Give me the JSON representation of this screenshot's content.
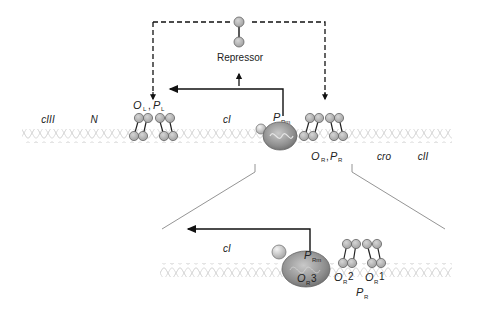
{
  "top": {
    "repressor_label": "Repressor",
    "genes": {
      "cIII": "cIII",
      "N": "N",
      "cI": "cI",
      "cro": "cro",
      "cII": "cII"
    },
    "left_operator": {
      "O": "O",
      "O_sub": "L",
      "sep": ",",
      "P": "P",
      "P_sub": "L"
    },
    "promoter_rm": {
      "P": "P",
      "P_sub": "Rm"
    },
    "right_operator": {
      "O": "O",
      "O_sub": "R",
      "sep": ",",
      "P": "P",
      "P_sub": "R"
    }
  },
  "zoom": {
    "cI": "cI",
    "promoter_rm": {
      "P": "P",
      "P_sub": "Rm"
    },
    "or3": {
      "O": "O",
      "sub": "R",
      "num": "3"
    },
    "or2": {
      "O": "O",
      "sub": "R",
      "num": "2"
    },
    "or1": {
      "O": "O",
      "sub": "R",
      "num": "1"
    },
    "pr": {
      "P": "P",
      "P_sub": "R"
    }
  },
  "colors": {
    "circle_fill": "#b8b8b8",
    "circle_stroke": "#6a6a6a",
    "dna": "#c8c8c8",
    "polymerase": "#8c8c8c",
    "arrow": "#111111",
    "zoom_lines": "#888888"
  }
}
